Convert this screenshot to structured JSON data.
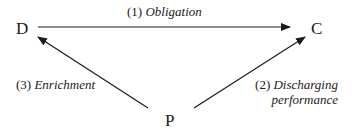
{
  "diagram": {
    "nodes": {
      "D": {
        "label": "D"
      },
      "C": {
        "label": "C"
      },
      "P": {
        "label": "P"
      }
    },
    "edges": [
      {
        "from": "D",
        "to": "C",
        "num": "(1)",
        "text": "Obligation"
      },
      {
        "from": "P",
        "to": "C",
        "num": "(2)",
        "text_line1": "Discharging",
        "text_line2": "performance"
      },
      {
        "from": "P",
        "to": "D",
        "num": "(3)",
        "text": "Enrichment"
      }
    ],
    "colors": {
      "line": "#1a1a1a",
      "background": "#ffffff"
    }
  }
}
